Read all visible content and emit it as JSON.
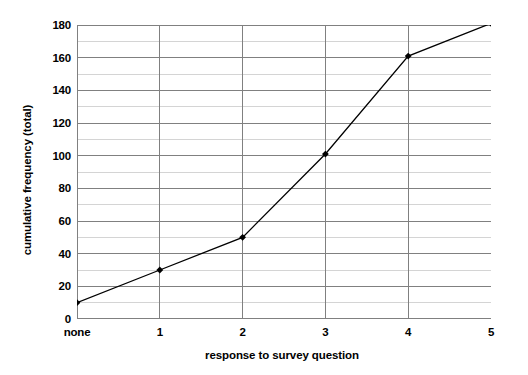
{
  "chart_data": {
    "type": "line",
    "title": "",
    "xlabel": "response to survey question",
    "ylabel": "cumulative frequency (total)",
    "categories": [
      "none",
      "1",
      "2",
      "3",
      "4",
      "5"
    ],
    "values": [
      10,
      30,
      50,
      101,
      161,
      181
    ],
    "series": [
      {
        "name": "cumulative frequency",
        "values": [
          10,
          30,
          50,
          101,
          161,
          181
        ]
      }
    ],
    "ylim": [
      0,
      180
    ],
    "y_major_ticks": [
      0,
      20,
      40,
      60,
      80,
      100,
      120,
      140,
      160,
      180
    ],
    "y_minor_step": 10,
    "y_tick_labels": [
      "0",
      "20",
      "40",
      "60",
      "80",
      "100",
      "120",
      "140",
      "160",
      "180"
    ],
    "grid": true,
    "legend": false,
    "legend_position": "none",
    "marker": "diamond",
    "line_color": "#000000",
    "marker_color": "#000000",
    "major_gridline_color": "#808080",
    "minor_gridline_color": "#d4d4d4",
    "axis_color": "#808080",
    "background_color": "#ffffff"
  }
}
